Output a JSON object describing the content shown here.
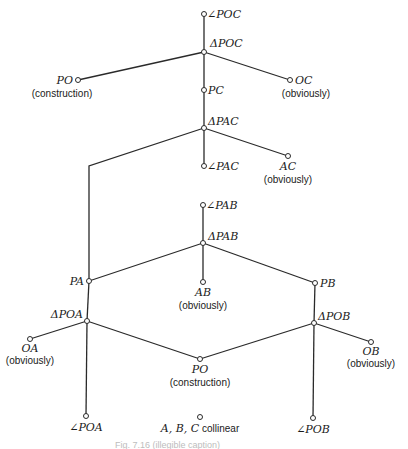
{
  "diagram": {
    "type": "proof-tree",
    "nodes": {
      "angle_poc": {
        "label": "∠POC"
      },
      "tri_poc": {
        "label": "ΔPOC"
      },
      "po_top": {
        "label": "PO",
        "note": "(construction)"
      },
      "oc": {
        "label": "OC",
        "note": "(obviously)"
      },
      "pc": {
        "label": "PC"
      },
      "tri_pac": {
        "label": "ΔPAC"
      },
      "angle_pac": {
        "label": "∠PAC"
      },
      "ac": {
        "label": "AC",
        "note": "(obviously)"
      },
      "angle_pab": {
        "label": "∠PAB"
      },
      "tri_pab": {
        "label": "ΔPAB"
      },
      "pa": {
        "label": "PA"
      },
      "ab": {
        "label": "AB",
        "note": "(obviously)"
      },
      "pb": {
        "label": "PB"
      },
      "tri_poa": {
        "label": "ΔPOA"
      },
      "oa": {
        "label": "OA",
        "note": "(obviously)"
      },
      "tri_pob": {
        "label": "ΔPOB"
      },
      "ob": {
        "label": "OB",
        "note": "(obviously)"
      },
      "po_bottom": {
        "label": "PO",
        "note": "(construction)"
      },
      "angle_poa": {
        "label": "∠POA"
      },
      "collinear": {
        "label_vars": "A, B, C",
        "label_text": " collinear"
      },
      "angle_pob": {
        "label": "∠POB"
      }
    },
    "edges": [
      [
        "angle_poc",
        "tri_poc"
      ],
      [
        "tri_poc",
        "po_top"
      ],
      [
        "tri_poc",
        "oc"
      ],
      [
        "tri_poc",
        "pc"
      ],
      [
        "pc",
        "tri_pac"
      ],
      [
        "tri_pac",
        "angle_pac"
      ],
      [
        "tri_pac",
        "ac"
      ],
      [
        "tri_pac",
        "pa"
      ],
      [
        "angle_pab",
        "tri_pab"
      ],
      [
        "tri_pab",
        "pa"
      ],
      [
        "tri_pab",
        "ab"
      ],
      [
        "tri_pab",
        "pb"
      ],
      [
        "pa",
        "tri_poa"
      ],
      [
        "pb",
        "tri_pob"
      ],
      [
        "tri_poa",
        "oa"
      ],
      [
        "tri_poa",
        "po_bottom"
      ],
      [
        "tri_poa",
        "angle_poa"
      ],
      [
        "tri_pob",
        "ob"
      ],
      [
        "tri_pob",
        "po_bottom"
      ],
      [
        "tri_pob",
        "angle_pob"
      ]
    ],
    "caption": "Fig. 7.16  (illegible caption)"
  }
}
